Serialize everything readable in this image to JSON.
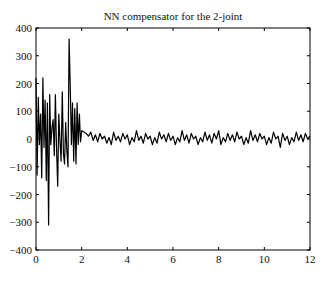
{
  "chart_data": {
    "type": "line",
    "title": "NN compensator for the 2-joint",
    "xlabel": "",
    "ylabel": "",
    "xlim": [
      0,
      12
    ],
    "ylim": [
      -400,
      400
    ],
    "xticks": [
      0,
      2,
      4,
      6,
      8,
      10,
      12
    ],
    "yticks": [
      -400,
      -300,
      -200,
      -100,
      0,
      100,
      200,
      300,
      400
    ],
    "grid": false,
    "legend": null,
    "series": [
      {
        "name": "NN compensator output",
        "color": "#000000",
        "x": [
          0.0,
          0.05,
          0.1,
          0.15,
          0.2,
          0.25,
          0.3,
          0.35,
          0.4,
          0.45,
          0.5,
          0.55,
          0.6,
          0.65,
          0.7,
          0.75,
          0.8,
          0.85,
          0.9,
          0.95,
          1.0,
          1.05,
          1.1,
          1.15,
          1.2,
          1.25,
          1.3,
          1.35,
          1.4,
          1.45,
          1.5,
          1.55,
          1.6,
          1.65,
          1.7,
          1.75,
          1.8,
          1.85,
          1.9,
          1.95,
          2.0,
          2.1,
          2.2,
          2.3,
          2.4,
          2.5,
          2.6,
          2.7,
          2.8,
          2.9,
          3.0,
          3.1,
          3.2,
          3.3,
          3.4,
          3.5,
          3.6,
          3.7,
          3.8,
          3.9,
          4.0,
          4.1,
          4.2,
          4.3,
          4.4,
          4.5,
          4.6,
          4.7,
          4.8,
          4.9,
          5.0,
          5.1,
          5.2,
          5.3,
          5.4,
          5.5,
          5.6,
          5.7,
          5.8,
          5.9,
          6.0,
          6.1,
          6.2,
          6.3,
          6.4,
          6.5,
          6.6,
          6.7,
          6.8,
          6.9,
          7.0,
          7.1,
          7.2,
          7.3,
          7.4,
          7.5,
          7.6,
          7.7,
          7.8,
          7.9,
          8.0,
          8.1,
          8.2,
          8.3,
          8.4,
          8.5,
          8.6,
          8.7,
          8.8,
          8.9,
          9.0,
          9.1,
          9.2,
          9.3,
          9.4,
          9.5,
          9.6,
          9.7,
          9.8,
          9.9,
          10.0,
          10.1,
          10.2,
          10.3,
          10.4,
          10.5,
          10.6,
          10.7,
          10.8,
          10.9,
          11.0,
          11.1,
          11.2,
          11.3,
          11.4,
          11.5,
          11.6,
          11.7,
          11.8,
          11.9,
          12.0
        ],
        "y": [
          220,
          -130,
          150,
          -20,
          90,
          -140,
          220,
          -30,
          140,
          -150,
          130,
          -310,
          160,
          -20,
          40,
          70,
          -60,
          160,
          -30,
          -170,
          90,
          -10,
          -80,
          170,
          -50,
          -90,
          60,
          -40,
          -100,
          360,
          180,
          -20,
          130,
          -80,
          110,
          -90,
          130,
          -20,
          90,
          -10,
          30,
          25,
          20,
          10,
          25,
          -5,
          15,
          -10,
          20,
          0,
          10,
          -15,
          5,
          -20,
          25,
          -5,
          10,
          -10,
          20,
          0,
          15,
          -20,
          5,
          -10,
          30,
          -5,
          10,
          -15,
          20,
          0,
          10,
          -20,
          5,
          -15,
          25,
          0,
          15,
          -10,
          20,
          -5,
          10,
          -20,
          5,
          -10,
          30,
          -5,
          15,
          -15,
          20,
          0,
          10,
          -20,
          5,
          -10,
          25,
          -5,
          15,
          -15,
          20,
          0,
          30,
          -20,
          5,
          -10,
          20,
          -5,
          15,
          -10,
          25,
          0,
          10,
          -20,
          5,
          -15,
          30,
          -5,
          15,
          -10,
          20,
          0,
          10,
          -20,
          5,
          -15,
          25,
          0,
          10,
          -30,
          20,
          -5,
          10,
          -20,
          5,
          -10,
          25,
          -5,
          15,
          -10,
          20,
          0,
          10
        ]
      }
    ]
  }
}
